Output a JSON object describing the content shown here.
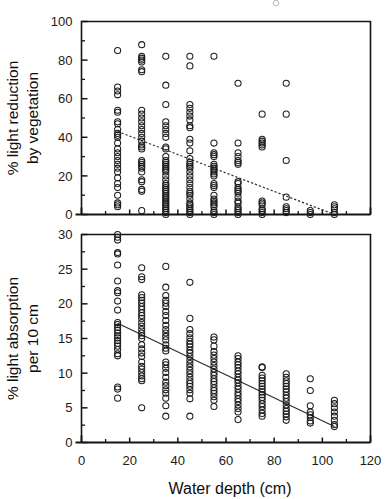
{
  "figure": {
    "title": "",
    "xlabel": "Water depth (cm)",
    "background_color": "#ffffff",
    "marker_color": "#1c1c1c",
    "line_color": "#2b2b2b"
  },
  "panels": {
    "top": {
      "ylabel_line1": "% light reduction",
      "ylabel_line2": "by vegetation",
      "y_ticks": [
        "0",
        "20",
        "40",
        "60",
        "80",
        "100"
      ],
      "y_minor_count": 5,
      "x_ticks": [
        "0",
        "20",
        "40",
        "60",
        "80",
        "100",
        "120"
      ],
      "x_tick_labels_visible": false
    },
    "bottom": {
      "ylabel_line1": "% light absorption",
      "ylabel_line2": "per 10 cm",
      "y_ticks": [
        "0",
        "5",
        "10",
        "15",
        "20",
        "25",
        "30"
      ],
      "x_ticks": [
        "0",
        "20",
        "40",
        "60",
        "80",
        "100",
        "120"
      ],
      "x_tick_labels_visible": true
    }
  },
  "chart_data": [
    {
      "type": "scatter",
      "panel": "top",
      "title": "",
      "xlabel": "Water depth (cm)",
      "ylabel": "% light reduction by vegetation",
      "xlim": [
        0,
        120
      ],
      "ylim": [
        0,
        100
      ],
      "xticks": [
        0,
        20,
        40,
        60,
        80,
        100,
        120
      ],
      "yticks": [
        0,
        20,
        40,
        60,
        80,
        100
      ],
      "grid": false,
      "legend": "none",
      "marker": "open-circle",
      "trendline": {
        "type": "linear-dashed",
        "x_start": 15,
        "y_start": 43,
        "x_end": 105,
        "y_end": 0,
        "slope": -0.478,
        "intercept": 50.2
      },
      "series": [
        {
          "name": "% light reduction by vegetation",
          "points_by_depth": [
            {
              "x": 15,
              "y": [
                85,
                66,
                64,
                62,
                54,
                53,
                48,
                47,
                44,
                42,
                41,
                40,
                37,
                34,
                32,
                30,
                28,
                26,
                24,
                22,
                19,
                16,
                14,
                10,
                6,
                5,
                4
              ]
            },
            {
              "x": 25,
              "y": [
                88,
                82,
                81,
                80,
                79,
                75,
                74,
                54,
                52,
                50,
                48,
                46,
                44,
                42,
                40,
                38,
                36,
                35,
                34,
                28,
                27,
                26,
                25,
                24,
                22,
                18,
                17,
                13,
                12,
                2
              ]
            },
            {
              "x": 35,
              "y": [
                82,
                67,
                57,
                48,
                46,
                44,
                42,
                40,
                35,
                34,
                30,
                28,
                27,
                26,
                25,
                24,
                23,
                22,
                20,
                18,
                16,
                15,
                14,
                13,
                12,
                11,
                10,
                9,
                8,
                7,
                6,
                5,
                4,
                3,
                2,
                1,
                0
              ]
            },
            {
              "x": 45,
              "y": [
                82,
                77,
                57,
                55,
                53,
                51,
                49,
                46,
                45,
                39,
                37,
                33,
                29,
                27,
                26,
                25,
                24,
                22,
                20,
                18,
                16,
                14,
                12,
                11,
                10,
                8,
                6,
                5,
                4,
                3,
                2,
                1,
                0
              ]
            },
            {
              "x": 55,
              "y": [
                82,
                37,
                32,
                31,
                30,
                26,
                25,
                24,
                23,
                22,
                21,
                20,
                16,
                15,
                14,
                10,
                8,
                7,
                6,
                5,
                4,
                2,
                1,
                0
              ]
            },
            {
              "x": 65,
              "y": [
                68,
                37,
                32,
                30,
                28,
                27,
                26,
                17,
                16,
                14,
                13,
                12,
                11,
                9,
                7,
                6,
                4,
                3,
                2,
                1,
                0
              ]
            },
            {
              "x": 75,
              "y": [
                52,
                39,
                38,
                37,
                36,
                35,
                7,
                6,
                5,
                3,
                2,
                1,
                0
              ]
            },
            {
              "x": 85,
              "y": [
                68,
                52,
                28,
                9,
                4,
                3,
                2,
                1
              ]
            },
            {
              "x": 95,
              "y": [
                2,
                1,
                0
              ]
            },
            {
              "x": 105,
              "y": [
                5,
                4,
                3,
                1,
                0
              ]
            }
          ]
        }
      ]
    },
    {
      "type": "scatter",
      "panel": "bottom",
      "title": "",
      "xlabel": "Water depth (cm)",
      "ylabel": "% light absorption per 10 cm",
      "xlim": [
        0,
        120
      ],
      "ylim": [
        0,
        30
      ],
      "xticks": [
        0,
        20,
        40,
        60,
        80,
        100,
        120
      ],
      "yticks": [
        0,
        5,
        10,
        15,
        20,
        25,
        30
      ],
      "grid": false,
      "legend": "none",
      "marker": "open-circle",
      "trendline": {
        "type": "linear-solid",
        "x_start": 15,
        "y_start": 17.2,
        "x_end": 105,
        "y_end": 2.3,
        "slope": -0.1656,
        "intercept": 19.68
      },
      "series": [
        {
          "name": "% light absorption per 10 cm",
          "points_by_depth": [
            {
              "x": 15,
              "y": [
                30,
                29.6,
                29.2,
                27.4,
                27.2,
                25.6,
                23.3,
                21.9,
                21.6,
                20.4,
                19.1,
                17.3,
                17.0,
                16.6,
                16.2,
                15.8,
                15.4,
                15.1,
                14.7,
                14.3,
                13.9,
                13.4,
                12.8,
                12.5,
                8.0,
                7.7,
                6.4
              ]
            },
            {
              "x": 25,
              "y": [
                25.2,
                23.9,
                23.5,
                21.3,
                20.9,
                20.5,
                20.1,
                19.6,
                19.2,
                18.7,
                18.3,
                17.9,
                17.3,
                16.8,
                16.3,
                15.8,
                15.4,
                15.0,
                14.1,
                13.5,
                12.9,
                12.4,
                11.6,
                11.0,
                10.6,
                10.1,
                9.6,
                9.2,
                8.9,
                5.0
              ]
            },
            {
              "x": 35,
              "y": [
                25.4,
                22.4,
                21.2,
                20.5,
                20.1,
                19.6,
                18.9,
                18.3,
                17.6,
                16.9,
                16.3,
                15.8,
                15.3,
                14.8,
                14.1,
                13.6,
                13.2,
                11.6,
                11.2,
                10.7,
                10.1,
                9.4,
                8.7,
                8.2,
                7.6,
                7.1,
                6.4,
                5.3,
                3.8
              ]
            },
            {
              "x": 45,
              "y": [
                23.1,
                17.9,
                16.3,
                15.7,
                15.1,
                14.6,
                14.2,
                13.8,
                13.3,
                12.9,
                12.4,
                11.9,
                11.4,
                10.9,
                10.4,
                9.9,
                9.4,
                8.9,
                8.5,
                8.1,
                7.6,
                7.1,
                6.3,
                3.8
              ]
            },
            {
              "x": 55,
              "y": [
                15.2,
                14.8,
                13.9,
                13.1,
                12.6,
                12.1,
                11.6,
                11.1,
                10.6,
                10.1,
                9.7,
                9.2,
                8.8,
                8.4,
                7.9,
                7.5,
                7.1,
                6.6,
                6.1,
                5.2
              ]
            },
            {
              "x": 65,
              "y": [
                12.5,
                12.1,
                11.6,
                11.2,
                10.8,
                10.3,
                9.9,
                9.4,
                9.0,
                8.6,
                8.1,
                7.7,
                7.2,
                6.8,
                6.3,
                5.9,
                5.4,
                4.9,
                4.4,
                3.3
              ]
            },
            {
              "x": 75,
              "y": [
                10.9,
                10.8,
                9.7,
                9.3,
                8.9,
                8.5,
                8.1,
                7.7,
                7.3,
                6.9,
                6.5,
                6.1,
                5.6,
                5.2,
                4.7,
                4.2,
                3.8
              ]
            },
            {
              "x": 85,
              "y": [
                9.9,
                9.4,
                8.9,
                8.5,
                8.1,
                7.7,
                7.3,
                6.8,
                6.4,
                5.9,
                5.4,
                4.9,
                4.5,
                4.1,
                3.7,
                3.2
              ]
            },
            {
              "x": 95,
              "y": [
                9.2,
                7.5,
                5.3,
                4.4,
                4.0,
                3.6,
                3.1,
                2.8
              ]
            },
            {
              "x": 105,
              "y": [
                6.1,
                5.6,
                5.0,
                4.4,
                3.8,
                3.2,
                2.6,
                2.3
              ]
            }
          ]
        }
      ]
    }
  ]
}
